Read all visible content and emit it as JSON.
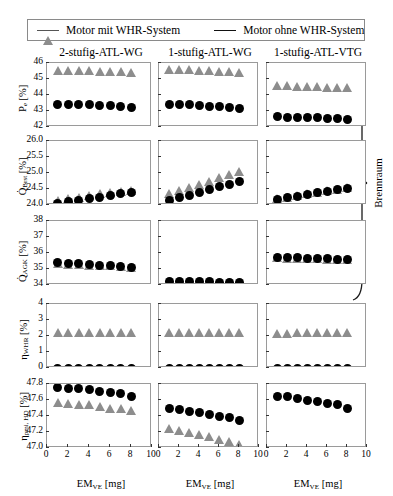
{
  "legend": {
    "items": [
      {
        "label": "Motor mit WHR-System",
        "marker": "triangle-marker",
        "color": "#8d8d8d"
      },
      {
        "label": "Motor ohne WHR-System",
        "marker": "circle-marker",
        "color": "#000000"
      }
    ]
  },
  "columns": [
    {
      "title": "2-stufig-ATL-WG"
    },
    {
      "title": "1-stufig-ATL-WG"
    },
    {
      "title": "1-stufig-ATL-VTG"
    }
  ],
  "annotation": {
    "brace_label": "Brennraum"
  },
  "xaxis": {
    "label_main": "EM",
    "label_sub": "VE",
    "label_unit": "[mg]",
    "ticks": [
      "0",
      "2",
      "4",
      "6",
      "8",
      "10"
    ],
    "min": 0,
    "max": 10
  },
  "rows": [
    {
      "ylabel_main": "P",
      "ylabel_sub": "e",
      "ylabel_unit": "[%]",
      "yticks": [
        "46",
        "45",
        "44",
        "43",
        "42"
      ],
      "ymin": 42,
      "ymax": 46
    },
    {
      "ylabel_main": "Q",
      "ylabel_sub": "Brst",
      "ylabel_unit": "[%]",
      "yticks": [
        "26.0",
        "25.5",
        "25.0",
        "24.5",
        "24.0"
      ],
      "ymin": 24.0,
      "ymax": 26.0
    },
    {
      "ylabel_main": "Q",
      "ylabel_sub": "AGK",
      "ylabel_unit": "[%]",
      "yticks": [
        "38",
        "37",
        "36",
        "35",
        "34"
      ],
      "ymin": 34,
      "ymax": 38
    },
    {
      "ylabel_main": "η",
      "ylabel_sub": "WHR",
      "ylabel_unit": "[%]",
      "yticks": [
        "4",
        "3",
        "2",
        "1",
        "0"
      ],
      "ymin": 0,
      "ymax": 4
    },
    {
      "ylabel_main": "η",
      "ylabel_sub": "pmi, HD",
      "ylabel_unit": "[%]",
      "yticks": [
        "47.8",
        "47.6",
        "47.4",
        "47.2",
        "47.0"
      ],
      "ymin": 47.0,
      "ymax": 47.8
    }
  ],
  "chart_data": {
    "type": "scatter",
    "title": "",
    "xlabel": "EM_VE [mg]",
    "grid": false,
    "legend_position": "top",
    "x": [
      1,
      2,
      3,
      4,
      5,
      6,
      7,
      8
    ],
    "panels": [
      {
        "row": 0,
        "col": 0,
        "column_title": "2-stufig-ATL-WG",
        "ylabel": "P_e [%]",
        "ylim": [
          42,
          46
        ],
        "series": [
          {
            "name": "Motor mit WHR-System",
            "marker": "triangle",
            "values": [
              45.55,
              45.55,
              45.55,
              45.55,
              45.5,
              45.5,
              45.45,
              45.4
            ]
          },
          {
            "name": "Motor ohne WHR-System",
            "marker": "circle",
            "values": [
              43.4,
              43.4,
              43.4,
              43.38,
              43.35,
              43.32,
              43.3,
              43.25
            ]
          }
        ]
      },
      {
        "row": 0,
        "col": 1,
        "column_title": "1-stufig-ATL-WG",
        "ylabel": "P_e [%]",
        "ylim": [
          42,
          46
        ],
        "series": [
          {
            "name": "Motor mit WHR-System",
            "marker": "triangle",
            "values": [
              45.6,
              45.6,
              45.58,
              45.55,
              45.52,
              45.5,
              45.45,
              45.42
            ]
          },
          {
            "name": "Motor ohne WHR-System",
            "marker": "circle",
            "values": [
              43.4,
              43.4,
              43.38,
              43.35,
              43.3,
              43.28,
              43.22,
              43.18
            ]
          }
        ]
      },
      {
        "row": 0,
        "col": 2,
        "column_title": "1-stufig-ATL-VTG",
        "ylabel": "P_e [%]",
        "ylim": [
          42,
          46
        ],
        "series": [
          {
            "name": "Motor mit WHR-System",
            "marker": "triangle",
            "values": [
              44.6,
              44.58,
              44.55,
              44.55,
              44.52,
              44.5,
              44.48,
              44.45
            ]
          },
          {
            "name": "Motor ohne WHR-System",
            "marker": "circle",
            "values": [
              42.65,
              42.62,
              42.6,
              42.6,
              42.58,
              42.55,
              42.52,
              42.5
            ]
          }
        ]
      },
      {
        "row": 1,
        "col": 0,
        "column_title": "2-stufig-ATL-WG",
        "ylabel": "Q_Brst [%]",
        "ylim": [
          24.0,
          26.0
        ],
        "series": [
          {
            "name": "Motor mit WHR-System",
            "marker": "triangle",
            "values": [
              24.15,
              24.2,
              24.25,
              24.3,
              24.35,
              24.4,
              24.42,
              24.45
            ]
          },
          {
            "name": "Motor ohne WHR-System",
            "marker": "circle",
            "values": [
              24.05,
              24.1,
              24.15,
              24.2,
              24.25,
              24.3,
              24.35,
              24.4
            ]
          }
        ]
      },
      {
        "row": 1,
        "col": 1,
        "column_title": "1-stufig-ATL-WG",
        "ylabel": "Q_Brst [%]",
        "ylim": [
          24.0,
          26.0
        ],
        "series": [
          {
            "name": "Motor mit WHR-System",
            "marker": "triangle",
            "values": [
              24.35,
              24.45,
              24.55,
              24.65,
              24.75,
              24.85,
              24.95,
              25.05
            ]
          },
          {
            "name": "Motor ohne WHR-System",
            "marker": "circle",
            "values": [
              24.15,
              24.22,
              24.3,
              24.4,
              24.5,
              24.58,
              24.65,
              24.72
            ]
          }
        ]
      },
      {
        "row": 1,
        "col": 2,
        "column_title": "1-stufig-ATL-VTG",
        "ylabel": "Q_Brst [%]",
        "ylim": [
          24.0,
          26.0
        ],
        "series": [
          {
            "name": "Motor mit WHR-System",
            "marker": "triangle",
            "values": [
              24.2,
              24.25,
              24.3,
              24.35,
              24.4,
              24.45,
              24.5,
              24.55
            ]
          },
          {
            "name": "Motor ohne WHR-System",
            "marker": "circle",
            "values": [
              24.18,
              24.23,
              24.28,
              24.33,
              24.38,
              24.43,
              24.48,
              24.52
            ]
          }
        ]
      },
      {
        "row": 2,
        "col": 0,
        "column_title": "2-stufig-ATL-WG",
        "ylabel": "Q_AGK [%]",
        "ylim": [
          34,
          38
        ],
        "series": [
          {
            "name": "Motor mit WHR-System",
            "marker": "triangle",
            "values": [
              35.35,
              35.3,
              35.28,
              35.25,
              35.22,
              35.2,
              35.15,
              35.1
            ]
          },
          {
            "name": "Motor ohne WHR-System",
            "marker": "circle",
            "values": [
              35.4,
              35.35,
              35.32,
              35.28,
              35.25,
              35.22,
              35.18,
              35.12
            ]
          }
        ]
      },
      {
        "row": 2,
        "col": 1,
        "column_title": "1-stufig-ATL-WG",
        "ylabel": "Q_AGK [%]",
        "ylim": [
          34,
          38
        ],
        "series": [
          {
            "name": "Motor mit WHR-System",
            "marker": "triangle",
            "values": [
              34.2,
              34.2,
              34.2,
              34.18,
              34.18,
              34.15,
              34.15,
              34.12
            ]
          },
          {
            "name": "Motor ohne WHR-System",
            "marker": "circle",
            "values": [
              34.22,
              34.22,
              34.22,
              34.2,
              34.2,
              34.18,
              34.18,
              34.15
            ]
          }
        ]
      },
      {
        "row": 2,
        "col": 2,
        "column_title": "1-stufig-ATL-VTG",
        "ylabel": "Q_AGK [%]",
        "ylim": [
          34,
          38
        ],
        "series": [
          {
            "name": "Motor mit WHR-System",
            "marker": "triangle",
            "values": [
              35.7,
              35.68,
              35.68,
              35.65,
              35.65,
              35.62,
              35.6,
              35.58
            ]
          },
          {
            "name": "Motor ohne WHR-System",
            "marker": "circle",
            "values": [
              35.72,
              35.7,
              35.7,
              35.68,
              35.66,
              35.64,
              35.62,
              35.6
            ]
          }
        ]
      },
      {
        "row": 3,
        "col": 0,
        "column_title": "2-stufig-ATL-WG",
        "ylabel": "η_WHR [%]",
        "ylim": [
          0,
          4
        ],
        "series": [
          {
            "name": "Motor mit WHR-System",
            "marker": "triangle",
            "values": [
              2.2,
              2.2,
              2.2,
              2.2,
              2.2,
              2.2,
              2.2,
              2.2
            ]
          },
          {
            "name": "Motor ohne WHR-System",
            "marker": "circle",
            "values": [
              0,
              0,
              0,
              0,
              0,
              0,
              0,
              0
            ]
          }
        ]
      },
      {
        "row": 3,
        "col": 1,
        "column_title": "1-stufig-ATL-WG",
        "ylabel": "η_WHR [%]",
        "ylim": [
          0,
          4
        ],
        "series": [
          {
            "name": "Motor mit WHR-System",
            "marker": "triangle",
            "values": [
              2.2,
              2.2,
              2.2,
              2.2,
              2.2,
              2.2,
              2.2,
              2.2
            ]
          },
          {
            "name": "Motor ohne WHR-System",
            "marker": "circle",
            "values": [
              0,
              0,
              0,
              0,
              0,
              0,
              0,
              0
            ]
          }
        ]
      },
      {
        "row": 3,
        "col": 2,
        "column_title": "1-stufig-ATL-VTG",
        "ylabel": "η_WHR [%]",
        "ylim": [
          0,
          4
        ],
        "series": [
          {
            "name": "Motor mit WHR-System",
            "marker": "triangle",
            "values": [
              2.18,
              2.18,
              2.2,
              2.22,
              2.2,
              2.2,
              2.2,
              2.22
            ]
          },
          {
            "name": "Motor ohne WHR-System",
            "marker": "circle",
            "values": [
              0,
              0,
              0,
              0,
              0,
              0,
              0,
              0
            ]
          }
        ]
      },
      {
        "row": 4,
        "col": 0,
        "column_title": "2-stufig-ATL-WG",
        "ylabel": "η_pmi, HD [%]",
        "ylim": [
          47.0,
          47.8
        ],
        "series": [
          {
            "name": "Motor mit WHR-System",
            "marker": "triangle",
            "values": [
              47.57,
              47.56,
              47.55,
              47.54,
              47.52,
              47.5,
              47.49,
              47.47
            ]
          },
          {
            "name": "Motor ohne WHR-System",
            "marker": "circle",
            "values": [
              47.76,
              47.75,
              47.74,
              47.73,
              47.71,
              47.7,
              47.68,
              47.65
            ]
          }
        ]
      },
      {
        "row": 4,
        "col": 1,
        "column_title": "1-stufig-ATL-WG",
        "ylabel": "η_pmi, HD [%]",
        "ylim": [
          47.0,
          47.8
        ],
        "series": [
          {
            "name": "Motor mit WHR-System",
            "marker": "triangle",
            "values": [
              47.25,
              47.22,
              47.2,
              47.17,
              47.14,
              47.11,
              47.08,
              47.05
            ]
          },
          {
            "name": "Motor ohne WHR-System",
            "marker": "circle",
            "values": [
              47.5,
              47.48,
              47.46,
              47.44,
              47.42,
              47.4,
              47.38,
              47.34
            ]
          }
        ]
      },
      {
        "row": 4,
        "col": 2,
        "column_title": "1-stufig-ATL-VTG",
        "ylabel": "η_pmi, HD [%]",
        "ylim": [
          47.0,
          47.8
        ],
        "series": [
          {
            "name": "Motor ohne WHR-System",
            "marker": "circle",
            "values": [
              47.65,
              47.64,
              47.62,
              47.6,
              47.58,
              47.56,
              47.54,
              47.5
            ]
          }
        ]
      }
    ]
  }
}
